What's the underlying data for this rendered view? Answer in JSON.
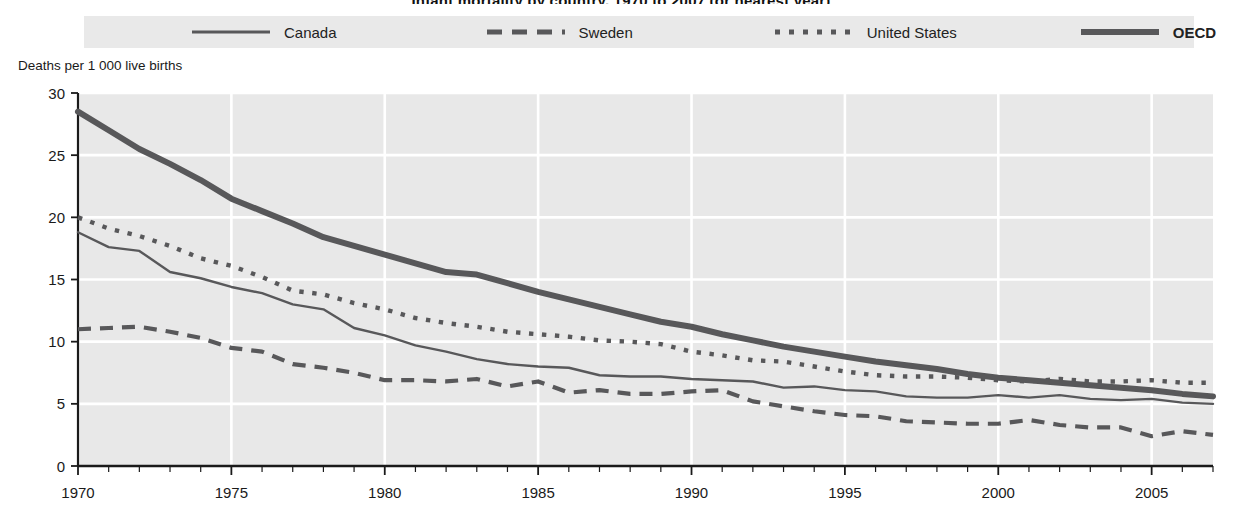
{
  "title": "Infant mortality by country, 1970 to 2007 (or nearest year)",
  "legend": {
    "position": "top",
    "items": [
      {
        "label": "Canada",
        "style": "solid",
        "color": "#58585a",
        "bold_text": false
      },
      {
        "label": "Sweden",
        "style": "dashed",
        "color": "#58585a",
        "bold_text": false
      },
      {
        "label": "United States",
        "style": "dotted",
        "color": "#58585a",
        "bold_text": false
      },
      {
        "label": "OECD",
        "style": "thick-solid",
        "color": "#58585a",
        "bold_text": true
      }
    ]
  },
  "axis_caption": "Deaths per 1 000 live births",
  "colors": {
    "plot_background": "#e8e8e8",
    "gridline": "#ffffff",
    "axis": "#1a1a1a",
    "series": "#58585a"
  },
  "chart_data": {
    "type": "line",
    "title": "Infant mortality by country, 1970 to 2007 (or nearest year)",
    "xlabel": "",
    "ylabel": "Deaths per 1 000 live births",
    "xlim": [
      1970,
      2007
    ],
    "ylim": [
      0,
      30
    ],
    "ytick_step": 5,
    "yticks": [
      0,
      5,
      10,
      15,
      20,
      25,
      30
    ],
    "xticks": [
      1970,
      1975,
      1980,
      1985,
      1990,
      1995,
      2000,
      2005
    ],
    "xtick_minor_step": 1,
    "grid": true,
    "legend_position": "top",
    "x": [
      1970,
      1971,
      1972,
      1973,
      1974,
      1975,
      1976,
      1977,
      1978,
      1979,
      1980,
      1981,
      1982,
      1983,
      1984,
      1985,
      1986,
      1987,
      1988,
      1989,
      1990,
      1991,
      1992,
      1993,
      1994,
      1995,
      1996,
      1997,
      1998,
      1999,
      2000,
      2001,
      2002,
      2003,
      2004,
      2005,
      2006,
      2007
    ],
    "series": [
      {
        "name": "Canada",
        "style": "solid",
        "values": [
          18.8,
          17.6,
          17.3,
          15.6,
          15.1,
          14.4,
          13.9,
          13.0,
          12.6,
          11.1,
          10.5,
          9.7,
          9.2,
          8.6,
          8.2,
          8.0,
          7.9,
          7.3,
          7.2,
          7.2,
          7.0,
          6.9,
          6.8,
          6.3,
          6.4,
          6.1,
          6.0,
          5.6,
          5.5,
          5.5,
          5.7,
          5.5,
          5.7,
          5.4,
          5.3,
          5.4,
          5.1,
          5.0
        ]
      },
      {
        "name": "Sweden",
        "style": "dashed",
        "values": [
          11.0,
          11.1,
          11.2,
          10.8,
          10.3,
          9.5,
          9.2,
          8.2,
          7.9,
          7.5,
          6.9,
          6.9,
          6.8,
          7.0,
          6.4,
          6.8,
          5.9,
          6.1,
          5.8,
          5.8,
          6.0,
          6.1,
          5.2,
          4.8,
          4.4,
          4.1,
          4.0,
          3.6,
          3.5,
          3.4,
          3.4,
          3.7,
          3.3,
          3.1,
          3.1,
          2.4,
          2.8,
          2.5
        ]
      },
      {
        "name": "United States",
        "style": "dotted",
        "values": [
          20.0,
          19.1,
          18.5,
          17.7,
          16.7,
          16.1,
          15.2,
          14.1,
          13.8,
          13.1,
          12.6,
          11.9,
          11.5,
          11.2,
          10.8,
          10.6,
          10.4,
          10.1,
          10.0,
          9.8,
          9.2,
          8.9,
          8.5,
          8.4,
          8.0,
          7.6,
          7.3,
          7.2,
          7.2,
          7.1,
          6.9,
          6.8,
          7.0,
          6.8,
          6.8,
          6.9,
          6.7,
          6.7
        ]
      },
      {
        "name": "OECD",
        "style": "thick-solid",
        "values": [
          28.5,
          27.0,
          25.5,
          24.3,
          23.0,
          21.5,
          20.5,
          19.5,
          18.4,
          17.7,
          17.0,
          16.3,
          15.6,
          15.4,
          14.7,
          14.0,
          13.4,
          12.8,
          12.2,
          11.6,
          11.2,
          10.6,
          10.1,
          9.6,
          9.2,
          8.8,
          8.4,
          8.1,
          7.8,
          7.4,
          7.1,
          6.9,
          6.7,
          6.5,
          6.3,
          6.1,
          5.8,
          5.6
        ]
      }
    ]
  }
}
